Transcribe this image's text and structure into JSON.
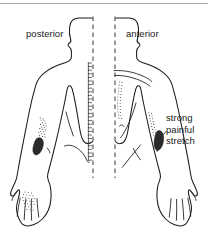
{
  "figure": {
    "type": "anatomical-line-drawing",
    "background_color": "#ffffff",
    "line_color": "#1a1a1a",
    "midline_color": "#4a4a4a",
    "stipple_color": "#3a3a3a",
    "dense_band_color": "#2b2b2b"
  },
  "labels": {
    "posterior": "posterior",
    "anterior": "anterior",
    "stretch_line1": "strong",
    "stretch_line2": "painful",
    "stretch_line3": "stretch"
  },
  "views": [
    {
      "name": "posterior",
      "label": "posterior",
      "side": "left",
      "midline_style": "dashed",
      "markings": [
        {
          "name": "lateral-elbow-stipple",
          "region": "lateral epicondyle",
          "intensity": "light-stipple"
        },
        {
          "name": "lateral-elbow-dense-band",
          "region": "lateral epicondyle",
          "intensity": "dense"
        },
        {
          "name": "dorsal-hand-stipple",
          "region": "dorsum of hand",
          "intensity": "light-stipple"
        },
        {
          "name": "vertebral-column",
          "region": "spine",
          "intensity": "segmented-line"
        }
      ]
    },
    {
      "name": "anterior",
      "label": "anterior",
      "side": "right",
      "midline_style": "dashed",
      "markings": [
        {
          "name": "lateral-elbow-stipple",
          "region": "lateral epicondyle",
          "intensity": "light-stipple"
        },
        {
          "name": "lateral-elbow-dense-band",
          "region": "lateral epicondyle",
          "intensity": "dense"
        },
        {
          "name": "sternum-stipple",
          "region": "sternum",
          "intensity": "light-stipple"
        },
        {
          "name": "clavicle-lines",
          "region": "clavicle",
          "intensity": "outline"
        }
      ]
    }
  ],
  "annotation": {
    "name": "strong-painful-stretch",
    "lines": [
      "strong",
      "painful",
      "stretch"
    ],
    "points_to": "lateral-elbow-dense-band",
    "leader": true
  }
}
